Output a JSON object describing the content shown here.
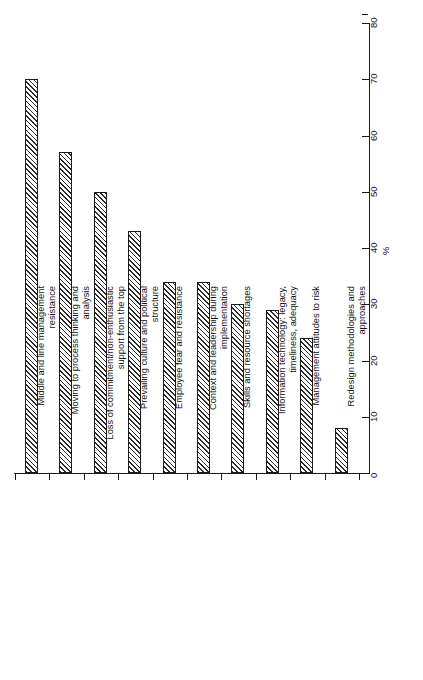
{
  "chart_data": {
    "type": "bar",
    "orientation": "rotated-vertical-bars",
    "title": "",
    "subtitle": "",
    "xlabel": "",
    "ylabel": "%",
    "ylim": [
      0,
      80
    ],
    "ytick_step": 10,
    "grid": false,
    "legend": null,
    "axis_unit_label": "%",
    "ytick_labels": [
      "0",
      "10",
      "20",
      "30",
      "40",
      "50",
      "60",
      "70",
      "80"
    ],
    "ytick_values": [
      0,
      10,
      20,
      30,
      40,
      50,
      60,
      70,
      80
    ],
    "categories": [
      "Middle and line management resistance",
      "Moving to process thinking and analysis",
      "Loss of commitment/non-enthusiastic support from the top",
      "Prevailing culture and political structure",
      "Employee fear and resistance",
      "Context and leadership during implementation",
      "Skills and resource shortages",
      "Information technology: legacy, timeliness, adequacy",
      "Management attitudes to risk",
      "Redesign methodologies and approaches"
    ],
    "category_lines": [
      [
        "Middle and line management",
        "resistance"
      ],
      [
        "Moving to process thinking and",
        "analysis"
      ],
      [
        "Loss of commitment/non-enthusiastic",
        "support from the top"
      ],
      [
        "Prevailing culture and political",
        "structure"
      ],
      [
        "Employee fear and resistance"
      ],
      [
        "Context and leadership during",
        "implementation"
      ],
      [
        "Skills and resource shortages"
      ],
      [
        "Information technology: legacy,",
        "timeliness, adequacy"
      ],
      [
        "Management attitudes to risk"
      ],
      [
        "Redesign methodologies and",
        "approaches"
      ]
    ],
    "values": [
      70,
      57,
      50,
      43,
      34,
      34,
      30,
      29,
      24,
      8
    ],
    "bar_style": {
      "fill": "diagonal-hatch",
      "hatch_color": "#2b2b2b",
      "background": "#ffffff",
      "outline": "#1a1a1a"
    }
  }
}
